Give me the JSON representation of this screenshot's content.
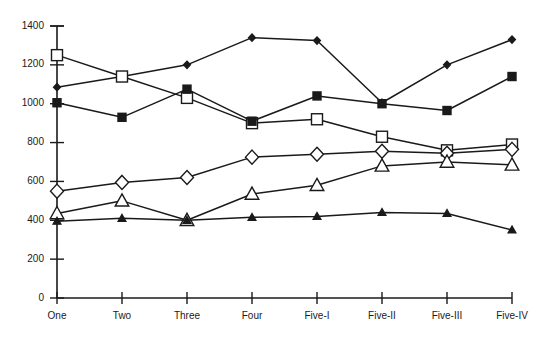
{
  "chart_data": {
    "type": "line",
    "title": "",
    "xlabel": "",
    "ylabel": "",
    "categories": [
      "One",
      "Two",
      "Three",
      "Four",
      "Five-I",
      "Five-II",
      "Five-III",
      "Five-IV"
    ],
    "ylim": [
      0,
      1400
    ],
    "yticks": [
      0,
      200,
      400,
      600,
      800,
      1000,
      1200,
      1400
    ],
    "ytick_labels": [
      "0",
      "200",
      "400",
      "600",
      "800",
      "1000",
      "1200",
      "1400"
    ],
    "grid": false,
    "legend": "none",
    "series": [
      {
        "name": "series-small-filled-diamond",
        "marker": "small-filled-diamond",
        "values": [
          1085,
          1140,
          1200,
          1340,
          1325,
          1005,
          1200,
          1330
        ]
      },
      {
        "name": "series-open-square",
        "marker": "open-square",
        "values": [
          1250,
          1140,
          1030,
          900,
          920,
          830,
          760,
          790
        ]
      },
      {
        "name": "series-filled-square",
        "marker": "filled-square",
        "values": [
          1005,
          930,
          1075,
          910,
          1040,
          1000,
          965,
          1140
        ]
      },
      {
        "name": "series-open-diamond",
        "marker": "open-diamond",
        "values": [
          550,
          595,
          620,
          725,
          740,
          755,
          745,
          765
        ]
      },
      {
        "name": "series-open-triangle",
        "marker": "open-triangle",
        "values": [
          435,
          500,
          400,
          535,
          580,
          680,
          700,
          685
        ]
      },
      {
        "name": "series-small-filled-triangle",
        "marker": "small-filled-triangle",
        "values": [
          395,
          410,
          400,
          415,
          420,
          440,
          435,
          350
        ]
      }
    ]
  },
  "axes": {
    "y_axis_name": "y-axis",
    "x_axis_name": "x-axis"
  }
}
